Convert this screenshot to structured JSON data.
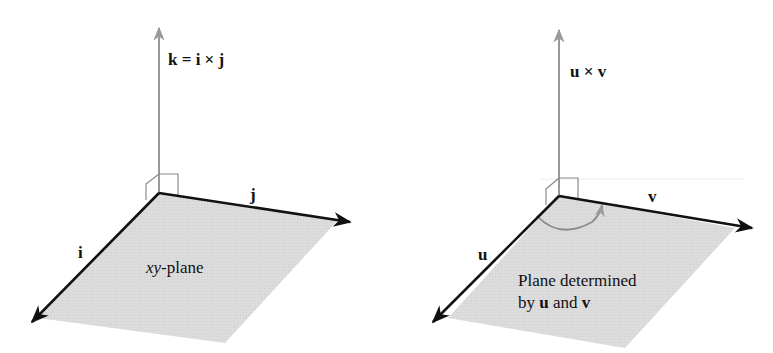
{
  "left_figure": {
    "normal_label": "k = i × j",
    "axis_i_label": "i",
    "axis_j_label": "j",
    "plane_label_italic": "xy",
    "plane_label_rest": "-plane"
  },
  "right_figure": {
    "normal_label": "u × v",
    "axis_u_label": "u",
    "axis_v_label": "v",
    "plane_label_line1": "Plane determined",
    "plane_label_line2_prefix": "by ",
    "plane_label_line2_u": "u",
    "plane_label_line2_mid": " and ",
    "plane_label_line2_v": "v"
  },
  "colors": {
    "plane_fill": "#d9d9d9",
    "normal_arrow": "#9a9a9a",
    "axis_arrow": "#111111"
  }
}
